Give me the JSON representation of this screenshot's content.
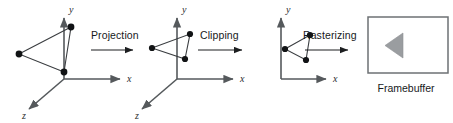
{
  "diagram": {
    "background_color": "#ffffff",
    "axis_color": "#55595c",
    "edge_color": "#3a3d40",
    "vertex_color": "#111315",
    "arrow_color": "#1c1e20",
    "framebuffer_fill": "#9a9da0",
    "framebuffer_border": "#6d7174"
  },
  "stages": [
    {
      "id": "model-space",
      "kind": "axes-3d",
      "axis_labels": {
        "x": "x",
        "y": "y",
        "z": "z"
      },
      "origin": [
        64,
        79
      ],
      "axes": {
        "x": {
          "to": [
            124,
            79
          ]
        },
        "y": {
          "to": [
            64,
            14
          ]
        },
        "z": {
          "to": [
            25,
            113
          ]
        }
      },
      "triangle": {
        "vertices": [
          [
            19,
            54
          ],
          [
            71,
            27
          ],
          [
            64,
            72
          ]
        ],
        "labels": [
          "v0",
          "v1",
          "v2"
        ]
      }
    },
    {
      "id": "projected-space",
      "kind": "axes-3d",
      "axis_labels": {
        "x": "x",
        "y": "y",
        "z": "z"
      },
      "origin": [
        177,
        79
      ],
      "axes": {
        "x": {
          "to": [
            237,
            79
          ]
        },
        "y": {
          "to": [
            177,
            14
          ]
        },
        "z": {
          "to": [
            138,
            113
          ]
        }
      },
      "triangle": {
        "vertices": [
          [
            152,
            48
          ],
          [
            190,
            34
          ],
          [
            185,
            59
          ]
        ],
        "labels": [
          "v0",
          "v1",
          "v2"
        ]
      }
    },
    {
      "id": "clipped-space",
      "kind": "axes-2d",
      "axis_labels": {
        "x": "x",
        "y": "y"
      },
      "origin": [
        281,
        79
      ],
      "axes": {
        "x": {
          "to": [
            330,
            79
          ]
        },
        "y": {
          "to": [
            281,
            14
          ]
        }
      },
      "triangle": {
        "vertices": [
          [
            285,
            49
          ],
          [
            310,
            35
          ],
          [
            306,
            60
          ]
        ],
        "labels": [
          "v0",
          "v1",
          "v2"
        ]
      }
    }
  ],
  "transitions": [
    {
      "id": "projection",
      "label": "Projection",
      "label_pos": [
        91,
        39
      ],
      "arrow": {
        "from": [
          91,
          50
        ],
        "to": [
          137,
          50
        ]
      }
    },
    {
      "id": "clipping",
      "label": "Clipping",
      "label_pos": [
        200,
        39
      ],
      "arrow": {
        "from": [
          198,
          50
        ],
        "to": [
          246,
          50
        ]
      }
    },
    {
      "id": "rasterizing",
      "label": "Rasterizing",
      "label_pos": [
        303,
        39
      ],
      "arrow": {
        "from": [
          305,
          50
        ],
        "to": [
          352,
          50
        ]
      }
    }
  ],
  "framebuffer": {
    "caption": "Framebuffer",
    "caption_pos": [
      406,
      92
    ],
    "rect": {
      "x": 368,
      "y": 17,
      "width": 80,
      "height": 56
    },
    "glyph": {
      "name": "left-pointing-triangle",
      "points": "403,33 403,58 385,45.5"
    }
  }
}
